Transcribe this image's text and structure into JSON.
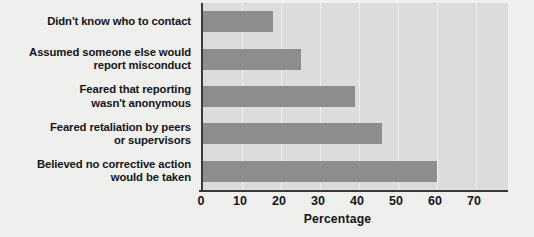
{
  "chart_data": {
    "type": "bar",
    "orientation": "horizontal",
    "title": "",
    "xlabel": "Percentage",
    "ylabel": "",
    "xlim": [
      0,
      70
    ],
    "ylim": null,
    "grid": true,
    "legend": null,
    "xticks": [
      "0",
      "10",
      "20",
      "30",
      "40",
      "50",
      "60",
      "70"
    ],
    "xtick_values": [
      0,
      10,
      20,
      30,
      40,
      50,
      60,
      70
    ],
    "categories": [
      "Didn't know who to contact",
      "Assumed someone else would\nreport misconduct",
      "Feared that reporting\nwasn't anonymous",
      "Feared retaliation by peers\nor supervisors",
      "Believed no corrective action\nwould be taken"
    ],
    "values": [
      18,
      25,
      39,
      46,
      60
    ],
    "colors": {
      "bar": "#8d8d8b",
      "plot_background": "#dcdcda",
      "figure_background": "#efefed",
      "axis": "#3a3a3c",
      "gridline": "#f0f0ee",
      "text": "#15151a"
    }
  }
}
